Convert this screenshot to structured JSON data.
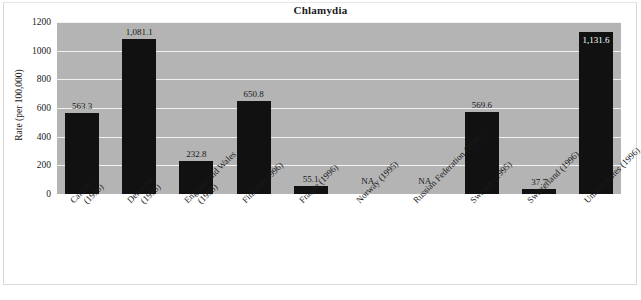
{
  "chart_data": {
    "type": "bar",
    "title": "Chlamydia",
    "xlabel": "",
    "ylabel": "Rate (per 100,000)",
    "ylim": [
      0,
      1200
    ],
    "ytick_step": 200,
    "yticks": [
      "1200",
      "1000",
      "800",
      "600",
      "400",
      "200",
      "0"
    ],
    "grid": true,
    "legend": "none",
    "categories": [
      "Canada (1996)",
      "Denmark (1996)",
      "England and Wales (1996)",
      "Finland (1996)",
      "France (1996)",
      "Norway (1995)",
      "Russian Federation (1996)",
      "Sweden (1995)",
      "Switzerland (1996)",
      "United States (1996)"
    ],
    "category_lines": [
      [
        "Canada",
        "(1996)"
      ],
      [
        "Denmark",
        "(1996)"
      ],
      [
        "England and Wales",
        "(1996)"
      ],
      [
        "Finland (1996)",
        ""
      ],
      [
        "France (1996)",
        ""
      ],
      [
        "Norway (1995)",
        ""
      ],
      [
        "Russian Federation (1996)",
        ""
      ],
      [
        "Sweden (1995)",
        ""
      ],
      [
        "Switzerland (1996)",
        ""
      ],
      [
        "United States (1996)",
        ""
      ]
    ],
    "values": [
      563.3,
      1081.1,
      232.8,
      650.8,
      55.1,
      null,
      null,
      569.6,
      37.7,
      1131.6
    ],
    "value_labels": [
      "563.3",
      "1,081.1",
      "232.8",
      "650.8",
      "55.1",
      "NA",
      "NA",
      "569.6",
      "37.7",
      "1,131.6"
    ],
    "missing_label": "NA",
    "colors": {
      "bar": "#111111",
      "plot_background": "#b4b4b4",
      "gridline": "#f2f2f2",
      "page_background": "#ffffff",
      "text": "#1a1a1a",
      "inside_label": "#ffffff"
    }
  }
}
